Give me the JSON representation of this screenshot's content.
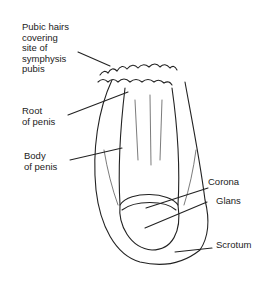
{
  "diagram": {
    "labels": {
      "pubic_hairs": "Pubic hairs\ncovering\nsite of\nsymphysis\npubis",
      "root": "Root\nof penis",
      "body": "Body\nof penis",
      "corona": "Corona",
      "glans": "Glans",
      "scrotum": "Scrotum"
    }
  }
}
